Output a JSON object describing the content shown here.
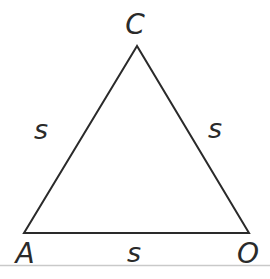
{
  "figure": {
    "background_color": "#ffffff",
    "line_color": "#2a2a2a",
    "scan_edge_color": "#c9c9c9",
    "vertices": {
      "top": "C",
      "bottom_left": "A",
      "bottom_right": "O"
    },
    "sides": {
      "left": "s",
      "right": "s",
      "bottom": "s"
    }
  }
}
